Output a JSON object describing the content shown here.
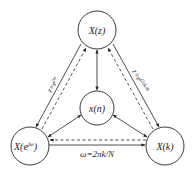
{
  "diagram": {
    "nodes": {
      "top": {
        "label": "X(z)"
      },
      "center": {
        "label": "x(n)"
      },
      "left": {
        "label": "X(e",
        "sup": "jω",
        "close": ")"
      },
      "right": {
        "label": "X(k)"
      }
    },
    "edges": {
      "left_label": "z=e",
      "left_label_sup": "jω",
      "right_label": "z=e",
      "right_label_sup": "j2πk/N",
      "bottom_label": "ω=2πk/N"
    },
    "colors": {
      "stroke": "#222222",
      "background": "#ffffff"
    }
  }
}
